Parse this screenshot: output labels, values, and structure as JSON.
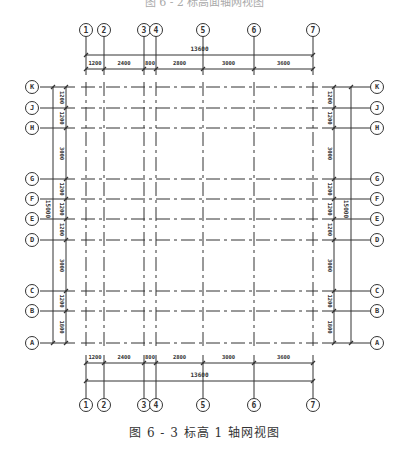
{
  "figure": {
    "caption": "图 6 - 3   标高 1 轴网视图",
    "top_caption_partial": "图 6 - 2   标高面轴网视图"
  },
  "colors": {
    "line": "#333333",
    "background": "#ffffff"
  },
  "vertical_axes": [
    {
      "label": "1",
      "x": 86
    },
    {
      "label": "2",
      "x": 104
    },
    {
      "label": "3",
      "x": 144
    },
    {
      "label": "4",
      "x": 156
    },
    {
      "label": "5",
      "x": 203
    },
    {
      "label": "6",
      "x": 254
    },
    {
      "label": "7",
      "x": 313
    }
  ],
  "horizontal_axes": [
    {
      "label": "K",
      "y": 87
    },
    {
      "label": "J",
      "y": 108
    },
    {
      "label": "H",
      "y": 128
    },
    {
      "label": "G",
      "y": 179
    },
    {
      "label": "F",
      "y": 199
    },
    {
      "label": "E",
      "y": 219
    },
    {
      "label": "D",
      "y": 240
    },
    {
      "label": "C",
      "y": 291
    },
    {
      "label": "B",
      "y": 311
    },
    {
      "label": "A",
      "y": 343
    }
  ],
  "top_dimensions": {
    "total": "13600",
    "segments": [
      "1200",
      "2400",
      "800",
      "2800",
      "3000",
      "3600"
    ]
  },
  "bottom_dimensions": {
    "total": "13600",
    "segments": [
      "1200",
      "2400",
      "800",
      "2800",
      "3000",
      "3600"
    ]
  },
  "left_dimensions": {
    "total": "15000",
    "segments": [
      "1200",
      "1200",
      "3000",
      "1200",
      "1200",
      "1200",
      "3000",
      "1200",
      "1800"
    ]
  },
  "right_dimensions": {
    "total": "15000",
    "segments": [
      "1200",
      "1200",
      "3000",
      "1200",
      "1200",
      "1200",
      "3000",
      "1200",
      "1800"
    ]
  }
}
